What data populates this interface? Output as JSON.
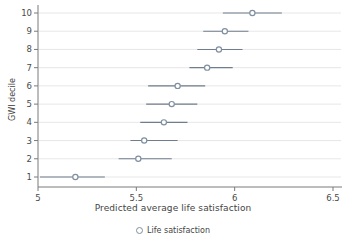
{
  "chart_data": {
    "type": "scatter",
    "title": "",
    "xlabel": "Predicted average life satisfaction",
    "ylabel": "GWI decile",
    "xlim": [
      5,
      6.5
    ],
    "ylim": [
      0.5,
      10.5
    ],
    "xticks": [
      "5",
      "5.5",
      "6",
      "6.5"
    ],
    "xtick_values": [
      5,
      5.5,
      6,
      6.5
    ],
    "yticks": [
      "1",
      "2",
      "3",
      "4",
      "5",
      "6",
      "7",
      "8",
      "9",
      "10"
    ],
    "ytick_values": [
      1,
      2,
      3,
      4,
      5,
      6,
      7,
      8,
      9,
      10
    ],
    "grid": "horizontal",
    "legend": [
      {
        "marker": "circle-open",
        "label": "Life satisfaction"
      }
    ],
    "series": [
      {
        "name": "Life satisfaction",
        "marker": "circle-open",
        "color": "#7f8fa0",
        "errorbar": "horizontal",
        "points": [
          {
            "decile": 1,
            "value": 5.19,
            "low": 5.01,
            "high": 5.34
          },
          {
            "decile": 2,
            "value": 5.51,
            "low": 5.41,
            "high": 5.68
          },
          {
            "decile": 3,
            "value": 5.54,
            "low": 5.47,
            "high": 5.71
          },
          {
            "decile": 4,
            "value": 5.64,
            "low": 5.52,
            "high": 5.76
          },
          {
            "decile": 5,
            "value": 5.68,
            "low": 5.55,
            "high": 5.81
          },
          {
            "decile": 6,
            "value": 5.71,
            "low": 5.56,
            "high": 5.85
          },
          {
            "decile": 7,
            "value": 5.86,
            "low": 5.77,
            "high": 5.99
          },
          {
            "decile": 8,
            "value": 5.92,
            "low": 5.81,
            "high": 6.04
          },
          {
            "decile": 9,
            "value": 5.95,
            "low": 5.84,
            "high": 6.07
          },
          {
            "decile": 10,
            "value": 6.09,
            "low": 5.94,
            "high": 6.24
          }
        ]
      }
    ],
    "colors": {
      "marker": "#7f8fa0",
      "errorbar": "#6f7d8c",
      "grid": "#dcdcdc",
      "axis": "#7a7a7a",
      "text": "#444444"
    }
  }
}
